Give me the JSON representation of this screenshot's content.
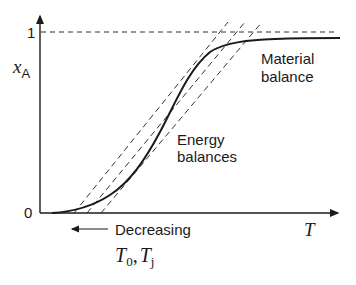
{
  "axes": {
    "y_label_main": "x",
    "y_label_sub": "A",
    "y_tick_top": "1",
    "y_tick_bottom": "0",
    "x_label": "T"
  },
  "annotations": {
    "material_line1": "Material",
    "material_line2": "balance",
    "energy_line1": "Energy",
    "energy_line2": "balances",
    "decreasing": "Decreasing",
    "t0_main": "T",
    "t0_sub": "0",
    "comma": ",",
    "tj_main": "T",
    "tj_sub": "j"
  },
  "colors": {
    "ink": "#1a1a1a",
    "dash": "#333333",
    "background": "#ffffff"
  }
}
